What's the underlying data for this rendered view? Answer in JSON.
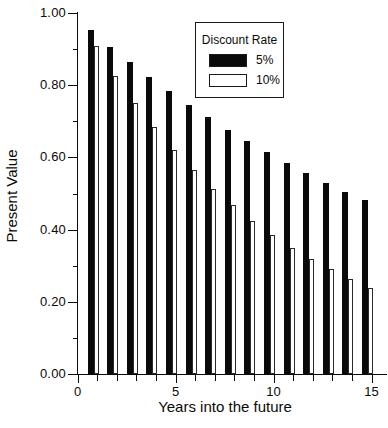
{
  "chart_data": {
    "type": "bar",
    "title": "",
    "xlabel": "Years into the future",
    "ylabel": "Present Value",
    "categories": [
      1,
      2,
      3,
      4,
      5,
      6,
      7,
      8,
      9,
      10,
      11,
      12,
      13,
      14,
      15
    ],
    "series": [
      {
        "name": "5%",
        "fill": "#0a0a0a",
        "style": "filled",
        "values": [
          0.952,
          0.907,
          0.864,
          0.823,
          0.784,
          0.746,
          0.711,
          0.677,
          0.645,
          0.614,
          0.585,
          0.557,
          0.53,
          0.505,
          0.481
        ]
      },
      {
        "name": "10%",
        "fill": "#ffffff",
        "style": "hollow",
        "values": [
          0.909,
          0.826,
          0.751,
          0.683,
          0.621,
          0.564,
          0.513,
          0.467,
          0.424,
          0.386,
          0.35,
          0.319,
          0.29,
          0.263,
          0.239
        ]
      }
    ],
    "xlim": [
      0,
      15.75
    ],
    "ylim": [
      0,
      1.0
    ],
    "x_major_ticks": [
      0,
      5,
      10,
      15
    ],
    "x_minor_ticks": [
      1,
      2,
      3,
      4,
      6,
      7,
      8,
      9,
      11,
      12,
      13,
      14
    ],
    "y_major_ticks": [
      0.0,
      0.2,
      0.4,
      0.6,
      0.8,
      1.0
    ],
    "y_minor_ticks": [
      0.1,
      0.3,
      0.5,
      0.7,
      0.9
    ],
    "y_tick_decimals": 2,
    "grid": false,
    "legend": {
      "title": "Discount Rate",
      "position": "top-right",
      "entries": [
        {
          "label": "5%",
          "fill": "#0a0a0a"
        },
        {
          "label": "10%",
          "fill": "#ffffff"
        }
      ]
    },
    "colors": {
      "axis": "#0a0a0a",
      "background": "#ffffff",
      "bar_series_1": "#0a0a0a",
      "bar_series_2": "#ffffff"
    }
  }
}
